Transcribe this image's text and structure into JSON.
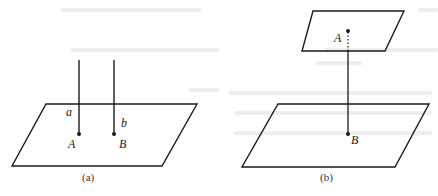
{
  "figure_a": {
    "caption": "(a)",
    "line_a_label": "a",
    "line_b_label": "b",
    "point_A_label": "A",
    "point_B_label": "B"
  },
  "figure_b": {
    "caption": "(b)",
    "point_A_label": "A",
    "point_B_label": "B"
  },
  "colors": {
    "ink": "#1a1a1a",
    "ghost_text": "#ececec"
  }
}
